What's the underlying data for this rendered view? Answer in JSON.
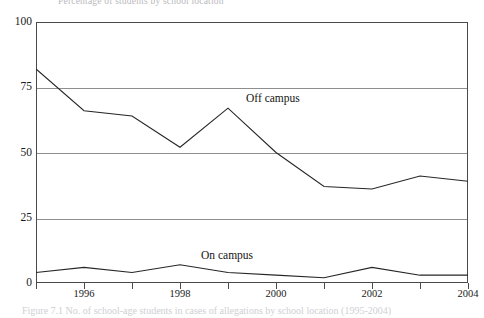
{
  "figure": {
    "title_clipped": "Percentage of students by school location",
    "caption_clipped": "Figure 7.1  No. of school-age students in cases of allegations by school location (1995-2004)"
  },
  "axes": {
    "y_ticks": [
      "0",
      "25",
      "50",
      "75",
      "100"
    ],
    "x_ticks": [
      "1996",
      "1998",
      "2000",
      "2002",
      "2004"
    ]
  },
  "labels": {
    "off_campus": "Off campus",
    "on_campus": "On campus"
  },
  "chart_data": {
    "type": "line",
    "title": "",
    "xlabel": "",
    "ylabel": "",
    "x": [
      1995,
      1996,
      1997,
      1998,
      1999,
      2000,
      2001,
      2002,
      2003,
      2004
    ],
    "xlim": [
      1995,
      2004
    ],
    "ylim": [
      0,
      100
    ],
    "ytick_values": [
      0,
      25,
      50,
      75,
      100
    ],
    "xtick_values": [
      1996,
      1998,
      2000,
      2002,
      2004
    ],
    "grid": "horizontal",
    "legend": "inline-annotations",
    "series": [
      {
        "name": "Off campus",
        "color": "#262626",
        "values": [
          82,
          66,
          64,
          52,
          67,
          50,
          37,
          36,
          41,
          39
        ]
      },
      {
        "name": "On campus",
        "color": "#262626",
        "values": [
          4,
          6,
          4,
          7,
          4,
          3,
          2,
          6,
          3,
          3
        ]
      }
    ]
  },
  "colors": {
    "line": "#262626",
    "grid": "#8e8e8e",
    "frame": "#4a4a4a",
    "background": "#ffffff"
  }
}
